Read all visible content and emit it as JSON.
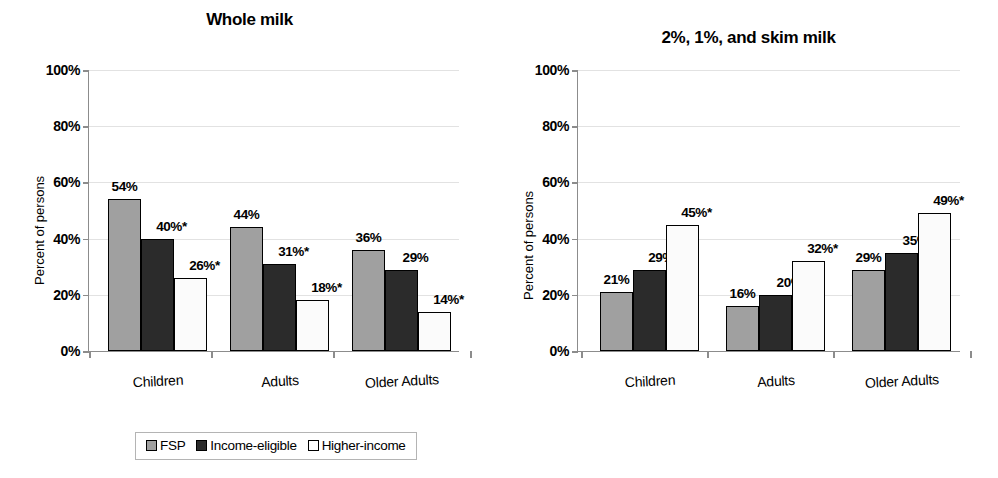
{
  "chart_data": [
    {
      "type": "bar",
      "title": "Whole milk",
      "xlabel": "",
      "ylabel": "Percent of persons",
      "ylim": [
        0,
        100
      ],
      "yticks": [
        "0%",
        "20%",
        "40%",
        "60%",
        "80%",
        "100%"
      ],
      "grid": true,
      "legend_position": "bottom",
      "categories": [
        "Children",
        "Adults",
        "Older Adults"
      ],
      "series": [
        {
          "name": "FSP",
          "color": "#a0a0a0",
          "values": [
            54,
            44,
            36
          ],
          "labels": [
            "54%",
            "44%",
            "36%"
          ]
        },
        {
          "name": "Income-eligible",
          "color": "#2b2b2b",
          "values": [
            40,
            31,
            29
          ],
          "labels": [
            "40%*",
            "31%*",
            "29%"
          ]
        },
        {
          "name": "Higher-income",
          "color": "#ffffff",
          "values": [
            26,
            18,
            14
          ],
          "labels": [
            "26%*",
            "18%*",
            "14%*"
          ]
        }
      ]
    },
    {
      "type": "bar",
      "title": "2%, 1%, and skim milk",
      "xlabel": "",
      "ylabel": "Percent of persons",
      "ylim": [
        0,
        100
      ],
      "yticks": [
        "0%",
        "20%",
        "40%",
        "60%",
        "80%",
        "100%"
      ],
      "grid": true,
      "legend_position": "bottom",
      "categories": [
        "Children",
        "Adults",
        "Older Adults"
      ],
      "series": [
        {
          "name": "FSP",
          "color": "#a0a0a0",
          "values": [
            21,
            16,
            29
          ],
          "labels": [
            "21%",
            "16%",
            "29%"
          ]
        },
        {
          "name": "Income-eligible",
          "color": "#2b2b2b",
          "values": [
            29,
            20,
            35
          ],
          "labels": [
            "29%*",
            "20%",
            "35%"
          ]
        },
        {
          "name": "Higher-income",
          "color": "#ffffff",
          "values": [
            45,
            32,
            49
          ],
          "labels": [
            "45%*",
            "32%*",
            "49%*"
          ]
        }
      ]
    }
  ],
  "panels": [
    {
      "id": "left",
      "title": "Whole milk",
      "ylabel": "Percent of persons",
      "yticks": [
        "0%",
        "20%",
        "40%",
        "60%",
        "80%",
        "100%"
      ],
      "categories": [
        "Children",
        "Adults",
        "Older Adults"
      ],
      "legend": [
        {
          "label": "FSP",
          "swatch": "fsp"
        },
        {
          "label": "Income-eligible",
          "swatch": "eligible"
        },
        {
          "label": "Higher-income",
          "swatch": "higher"
        }
      ]
    },
    {
      "id": "right",
      "title": "2%, 1%, and skim milk",
      "ylabel": "Percent of persons",
      "yticks": [
        "0%",
        "20%",
        "40%",
        "60%",
        "80%",
        "100%"
      ],
      "categories": [
        "Children",
        "Adults",
        "Older Adults"
      ],
      "legend": [
        {
          "label": "FSP",
          "swatch": "fsp"
        },
        {
          "label": "Income-eligible",
          "swatch": "eligible"
        },
        {
          "label": "Higher-income",
          "swatch": "higher"
        }
      ]
    }
  ]
}
